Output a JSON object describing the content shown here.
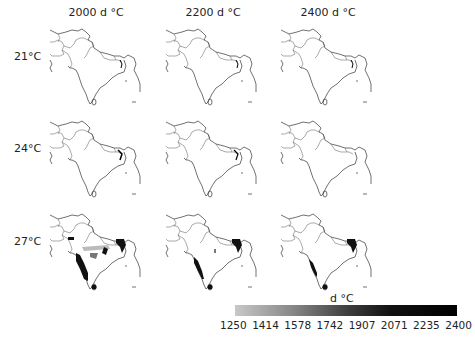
{
  "columns": [
    {
      "label": "2000 d °C"
    },
    {
      "label": "2200 d °C"
    },
    {
      "label": "2400 d °C"
    }
  ],
  "rows": [
    {
      "label": "21°C"
    },
    {
      "label": "24°C"
    },
    {
      "label": "27°C"
    }
  ],
  "map_region": "South Asia (Indian subcontinent)",
  "panels": [
    {
      "row": "21°C",
      "col": "2000 d °C",
      "suitable_area": "none"
    },
    {
      "row": "21°C",
      "col": "2200 d °C",
      "suitable_area": "none"
    },
    {
      "row": "21°C",
      "col": "2400 d °C",
      "suitable_area": "none"
    },
    {
      "row": "24°C",
      "col": "2000 d °C",
      "suitable_area": "trace in northeast"
    },
    {
      "row": "24°C",
      "col": "2200 d °C",
      "suitable_area": "trace in northeast"
    },
    {
      "row": "24°C",
      "col": "2400 d °C",
      "suitable_area": "none"
    },
    {
      "row": "27°C",
      "col": "2000 d °C",
      "suitable_area": "western coast, northeast, Sri Lanka, central patches"
    },
    {
      "row": "27°C",
      "col": "2200 d °C",
      "suitable_area": "western coast, northeast, Sri Lanka"
    },
    {
      "row": "27°C",
      "col": "2400 d °C",
      "suitable_area": "western coast (narrower), northeast, Sri Lanka"
    }
  ],
  "colorbar": {
    "title": "d °C",
    "ticks": [
      "1250",
      "1414",
      "1578",
      "1742",
      "1907",
      "2071",
      "2235",
      "2400"
    ],
    "color_low": "#c8c8c8",
    "color_high": "#000000"
  }
}
